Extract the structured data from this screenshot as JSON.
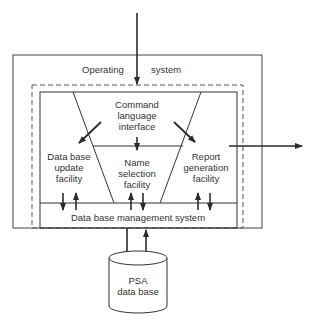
{
  "diagram": {
    "colors": {
      "line": "#2a2a2a",
      "text": "#333333",
      "background": "#ffffff"
    },
    "operating_system": {
      "label_left": "Operating",
      "label_right": "system"
    },
    "command_interface": {
      "lines": [
        "Command",
        "language",
        "interface"
      ]
    },
    "update_facility": {
      "lines": [
        "Data base",
        "update",
        "facility"
      ]
    },
    "name_selection": {
      "lines": [
        "Name",
        "selection",
        "facility"
      ]
    },
    "report_generation": {
      "lines": [
        "Report",
        "generation",
        "facility"
      ]
    },
    "dbms": {
      "label": "Data base management system"
    },
    "database": {
      "lines": [
        "PSA",
        "data base"
      ]
    }
  }
}
